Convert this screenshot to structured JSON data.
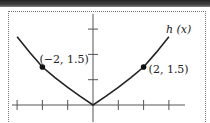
{
  "chart_data": {
    "type": "line",
    "title": "",
    "xlabel": "",
    "ylabel": "",
    "function_label": "h (x)",
    "xlim": [
      -3,
      3
    ],
    "ylim": [
      0,
      3
    ],
    "x_ticks": [
      -3,
      -2,
      -1,
      0,
      1,
      2,
      3
    ],
    "y_ticks": [
      1,
      2,
      3
    ],
    "tick_labels_shown": false,
    "grid": false,
    "legend": "none",
    "series": [
      {
        "name": "h (x)",
        "x": [
          -3,
          -2.5,
          -2,
          -1.5,
          -1,
          -0.5,
          0,
          0.5,
          1,
          1.5,
          2,
          2.5,
          3
        ],
        "values": [
          2.7,
          2.08,
          1.5,
          1.08,
          0.7,
          0.34,
          0,
          0.34,
          0.7,
          1.08,
          1.5,
          2.08,
          2.7
        ]
      }
    ],
    "annotations": [
      {
        "x": -2,
        "y": 1.5,
        "text": "(−2, 1.5)",
        "marker": "filled-circle"
      },
      {
        "x": 2,
        "y": 1.5,
        "text": "(2, 1.5)",
        "marker": "filled-circle"
      }
    ]
  }
}
